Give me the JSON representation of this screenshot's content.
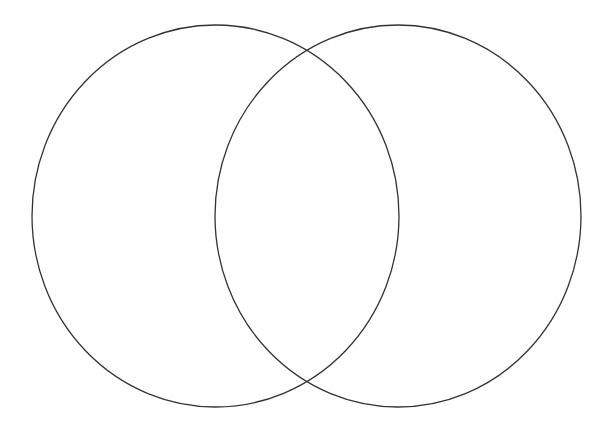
{
  "diagram": {
    "type": "venn",
    "canvas": {
      "width": 610,
      "height": 429,
      "background": "#ffffff"
    },
    "stroke_color": "#333333",
    "stroke_width": 1.3,
    "sets": [
      {
        "id": "left-set",
        "label": "",
        "cx": 215.5,
        "cy": 216,
        "rx": 183.5,
        "ry": 191
      },
      {
        "id": "right-set",
        "label": "",
        "cx": 398,
        "cy": 216,
        "rx": 183,
        "ry": 191
      }
    ],
    "intersections": [
      {
        "x": 307,
        "y": 52
      },
      {
        "x": 307,
        "y": 382
      }
    ]
  }
}
